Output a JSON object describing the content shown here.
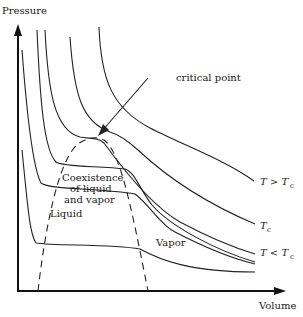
{
  "diagram": {
    "y_axis_label": "Pressure",
    "x_axis_label": "Volume",
    "annotation_critical": "critical point",
    "region_coexistence": [
      "Coexistence",
      "of liquid",
      "and vapor"
    ],
    "region_liquid": "Liquid",
    "region_vapor": "Vapor",
    "isotherm_labels": {
      "above": "T > T",
      "above_sub": "c",
      "critical": "T",
      "critical_sub": "c",
      "below": "T < T",
      "below_sub": "c"
    }
  }
}
